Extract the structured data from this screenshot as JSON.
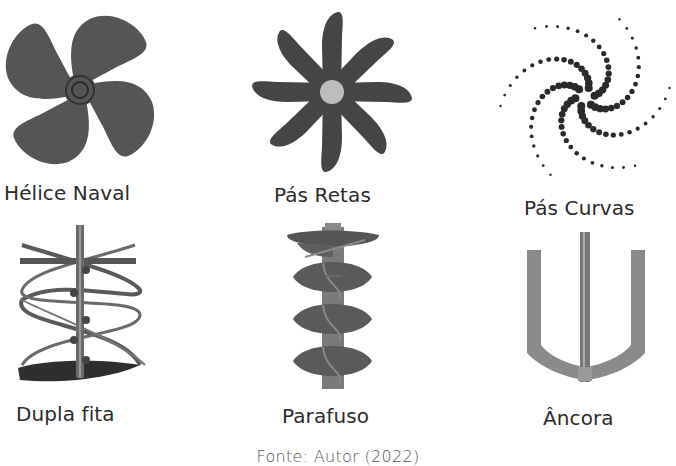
{
  "figure": {
    "items": [
      {
        "label": "Hélice Naval",
        "icon": "naval-propeller-impeller"
      },
      {
        "label": "Pás Retas",
        "icon": "straight-blade-impeller"
      },
      {
        "label": "Pás Curvas",
        "icon": "curved-blade-impeller"
      },
      {
        "label": "Dupla fita",
        "icon": "double-ribbon-impeller"
      },
      {
        "label": "Parafuso",
        "icon": "screw-impeller"
      },
      {
        "label": "Âncora",
        "icon": "anchor-impeller"
      }
    ],
    "caption": "Fonte: Autor (2022)"
  },
  "colors": {
    "propeller": "#555555",
    "blades": "#454545",
    "hub_light": "#bdbdbd",
    "dots": "#2a2a2a",
    "metal": "#7a7a7a",
    "anchor": "#8a8a8a",
    "text": "#2b2b2b"
  }
}
